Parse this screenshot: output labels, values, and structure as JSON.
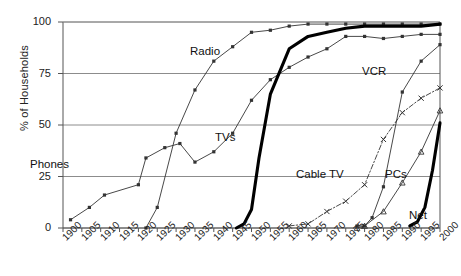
{
  "chart_data": {
    "type": "line",
    "title": "",
    "xlabel": "",
    "ylabel": "% of Households",
    "xlim": [
      1900,
      2000
    ],
    "ylim": [
      0,
      100
    ],
    "grid": true,
    "legend_position": "inline-annotations",
    "y_ticks": [
      0,
      25,
      50,
      75,
      100
    ],
    "x_ticks": [
      1900,
      1905,
      1910,
      1915,
      1920,
      1925,
      1930,
      1935,
      1940,
      1945,
      1950,
      1955,
      1960,
      1965,
      1970,
      1975,
      1980,
      1985,
      1990,
      1995,
      2000
    ],
    "series": [
      {
        "name": "Phones",
        "style": "thin-line-square-markers",
        "color": "#333333",
        "x": [
          1902,
          1907,
          1911,
          1920,
          1922,
          1927,
          1931,
          1935,
          1940,
          1945,
          1950,
          1955,
          1960,
          1965,
          1970,
          1975,
          1980,
          1985,
          1990,
          1995,
          2000
        ],
        "values": [
          4,
          10,
          16,
          21,
          34,
          39,
          41,
          32,
          37,
          46,
          62,
          72,
          78,
          83,
          87,
          93,
          93,
          92,
          93,
          94,
          94
        ]
      },
      {
        "name": "Radio",
        "style": "thin-line-square-markers",
        "color": "#333333",
        "x": [
          1922,
          1925,
          1930,
          1935,
          1940,
          1945,
          1950,
          1955,
          1960,
          1965,
          1970,
          1975,
          1980,
          1985,
          1990,
          1995,
          2000
        ],
        "values": [
          0,
          10,
          46,
          67,
          81,
          88,
          95,
          96,
          98,
          99,
          99,
          99,
          99,
          99,
          99,
          99,
          99
        ]
      },
      {
        "name": "TVs",
        "style": "thick-line",
        "color": "#000000",
        "x": [
          1946,
          1948,
          1950,
          1952,
          1955,
          1960,
          1965,
          1970,
          1975,
          1980,
          1985,
          1990,
          1995,
          2000
        ],
        "values": [
          0,
          2,
          9,
          34,
          65,
          87,
          93,
          95,
          97,
          98,
          98,
          98,
          98,
          99
        ]
      },
      {
        "name": "Cable TV",
        "style": "dash-dot-x-markers",
        "color": "#333333",
        "x": [
          1960,
          1965,
          1970,
          1975,
          1980,
          1985,
          1990,
          1995,
          2000
        ],
        "values": [
          1,
          2,
          8,
          13,
          21,
          43,
          56,
          63,
          68
        ]
      },
      {
        "name": "VCR",
        "style": "thin-line-square-markers",
        "color": "#333333",
        "x": [
          1978,
          1980,
          1982,
          1985,
          1990,
          1995,
          2000
        ],
        "values": [
          1,
          1,
          5,
          20,
          66,
          81,
          89
        ]
      },
      {
        "name": "PCs",
        "style": "thin-line-triangle-markers",
        "color": "#333333",
        "x": [
          1978,
          1980,
          1985,
          1990,
          1995,
          2000
        ],
        "values": [
          0,
          1,
          8,
          22,
          37,
          57
        ]
      },
      {
        "name": "Net",
        "style": "thick-line",
        "color": "#000000",
        "x": [
          1992,
          1994,
          1996,
          1998,
          2000
        ],
        "values": [
          1,
          3,
          10,
          28,
          51
        ]
      }
    ],
    "annotations": [
      {
        "text": "Radio",
        "x_px": 190,
        "y_px": 45
      },
      {
        "text": "VCR",
        "x_px": 362,
        "y_px": 65
      },
      {
        "text": "TVs",
        "x_px": 215,
        "y_px": 131
      },
      {
        "text": "Cable TV",
        "x_px": 296,
        "y_px": 168
      },
      {
        "text": "PCs",
        "x_px": 385,
        "y_px": 168
      },
      {
        "text": "Phones",
        "x_px": 30,
        "y_px": 158
      },
      {
        "text": "Net",
        "x_px": 409,
        "y_px": 209
      }
    ]
  }
}
